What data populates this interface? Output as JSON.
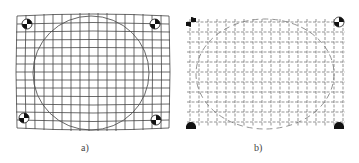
{
  "figure": {
    "panels": [
      {
        "id": "a",
        "label": "a)",
        "description": "distorted grid with circle and four corner calibration targets"
      },
      {
        "id": "b",
        "label": "b)",
        "description": "corrected dotted grid with broken circle and four corner calibration targets"
      }
    ],
    "colors": {
      "line": "#333333",
      "target_fill": "#111111",
      "background": "#ffffff"
    }
  }
}
